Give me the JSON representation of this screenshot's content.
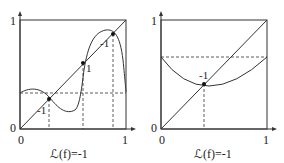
{
  "left_plot": {
    "y_ticks": {
      "zero": "0",
      "one": "1"
    },
    "x_ticks": {
      "zero": "0",
      "one": "1"
    },
    "caption": "ℒ(f)=-1",
    "fixed_points": [
      {
        "label": "-1"
      },
      {
        "label": "1"
      },
      {
        "label": "-1"
      }
    ]
  },
  "right_plot": {
    "y_ticks": {
      "zero": "0",
      "one": "1"
    },
    "x_ticks": {
      "zero": "0",
      "one": "1"
    },
    "caption": "ℒ(f)=-1",
    "fixed_points": [
      {
        "label": "-1"
      }
    ]
  }
}
